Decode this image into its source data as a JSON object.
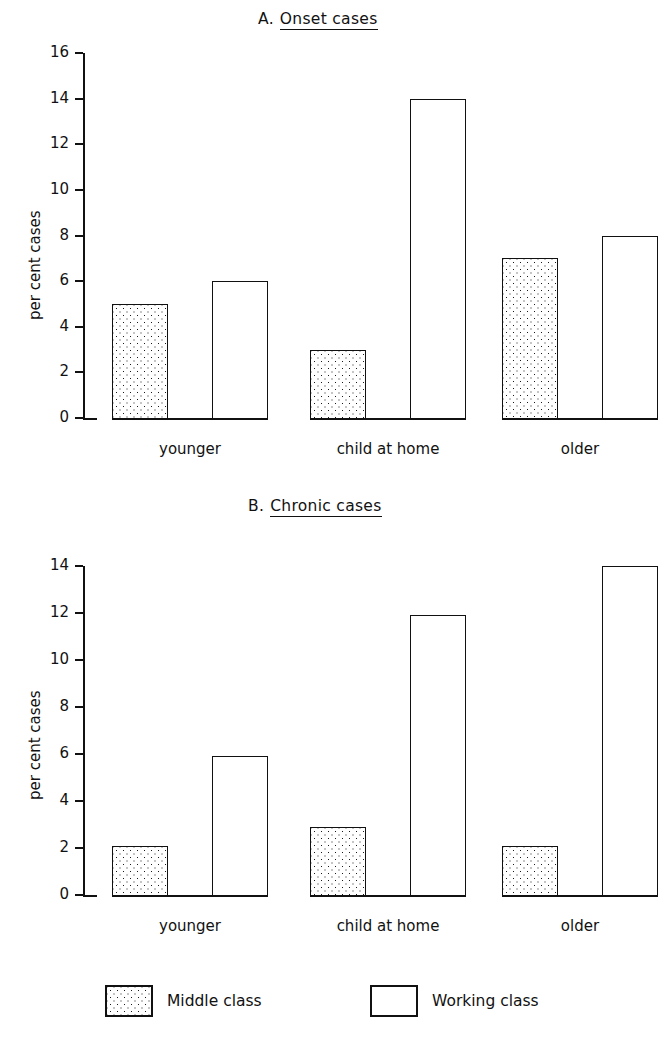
{
  "figure": {
    "background": "#ffffff",
    "ink": "#111111"
  },
  "legend": {
    "position": "bottom",
    "items": [
      {
        "key": "middle",
        "label": "Middle class",
        "fill": "dotted"
      },
      {
        "key": "working",
        "label": "Working class",
        "fill": "white"
      }
    ]
  },
  "panelA": {
    "prefix": "A.",
    "title": "Onset cases",
    "ylabel": "per cent cases"
  },
  "panelB": {
    "prefix": "B.",
    "title": "Chronic cases",
    "ylabel": "per cent cases"
  },
  "chart_data": [
    {
      "id": "A",
      "type": "bar",
      "title": "A. Onset cases",
      "xlabel": "",
      "ylabel": "per cent cases",
      "ylim": [
        0,
        16
      ],
      "yticks": [
        0,
        2,
        4,
        6,
        8,
        10,
        12,
        14,
        16
      ],
      "ytick_labels": [
        "0",
        "2",
        "4",
        "6",
        "8",
        "10",
        "12",
        "14",
        "16"
      ],
      "grid": false,
      "legend_position": "bottom",
      "categories": [
        "younger",
        "child at home",
        "older"
      ],
      "series": [
        {
          "name": "Middle class",
          "fill": "dotted",
          "values": [
            5,
            3,
            7
          ]
        },
        {
          "name": "Working class",
          "fill": "white",
          "values": [
            6,
            14,
            8
          ]
        }
      ]
    },
    {
      "id": "B",
      "type": "bar",
      "title": "B. Chronic cases",
      "xlabel": "",
      "ylabel": "per cent cases",
      "ylim": [
        0,
        14
      ],
      "yticks": [
        0,
        2,
        4,
        6,
        8,
        10,
        12,
        14
      ],
      "ytick_labels": [
        "0",
        "2",
        "4",
        "6",
        "8",
        "10",
        "12",
        "14"
      ],
      "grid": false,
      "legend_position": "bottom",
      "categories": [
        "younger",
        "child at home",
        "older"
      ],
      "series": [
        {
          "name": "Middle class",
          "fill": "dotted",
          "values": [
            2.1,
            2.9,
            2.1
          ]
        },
        {
          "name": "Working class",
          "fill": "white",
          "values": [
            5.9,
            11.9,
            14
          ]
        }
      ]
    }
  ]
}
